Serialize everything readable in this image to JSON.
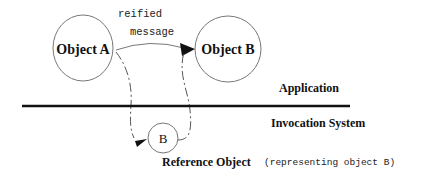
{
  "diagram": {
    "nodes": {
      "object_a": {
        "label": "Object A"
      },
      "object_b": {
        "label": "Object B"
      },
      "reference_b": {
        "label": "B"
      }
    },
    "edge_labels": {
      "line1": "reified",
      "line2": "message"
    },
    "layers": {
      "upper": "Application",
      "lower": "Invocation System"
    },
    "reference": {
      "title": "Reference Object",
      "note": "(representing object B)"
    },
    "colors": {
      "stroke": "#666666",
      "divider": "#111111",
      "text": "#111111",
      "arrowhead": "#111111"
    }
  }
}
